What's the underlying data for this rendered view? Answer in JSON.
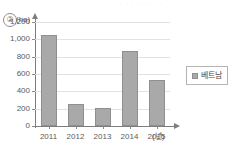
{
  "item_number": "②",
  "page_bleed_text": "· · · · · · · ·",
  "legend": {
    "swatch_name": "series-swatch",
    "label": "베트남",
    "color": "#a9a9a9"
  },
  "axes": {
    "y_unit": "(ha)",
    "x_unit": "(년)"
  },
  "chart_data": {
    "type": "bar",
    "title": "",
    "xlabel": "(년)",
    "ylabel": "(ha)",
    "categories": [
      "2011",
      "2012",
      "2013",
      "2014",
      "2015"
    ],
    "values": [
      1050,
      250,
      205,
      860,
      530
    ],
    "series": [
      {
        "name": "베트남",
        "values": [
          1050,
          250,
          205,
          860,
          530
        ],
        "color": "#a9a9a9"
      }
    ],
    "ylim": [
      0,
      1200
    ],
    "yticks": [
      0,
      200,
      400,
      600,
      800,
      1000,
      1200
    ],
    "ytick_labels": [
      "0",
      "200",
      "400",
      "600",
      "800",
      "1,000",
      "1,200"
    ],
    "grid": true,
    "legend_position": "right"
  }
}
